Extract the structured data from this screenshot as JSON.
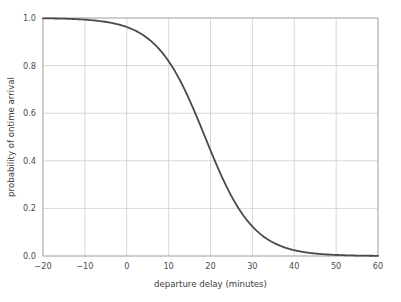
{
  "chart_data": {
    "type": "line",
    "title": "",
    "xlabel": "departure delay (minutes)",
    "ylabel": "probability of ontime arrival",
    "xlim": [
      -20,
      60
    ],
    "ylim": [
      0.0,
      1.0
    ],
    "grid": true,
    "legend": null,
    "xticks": [
      -20,
      -10,
      0,
      10,
      20,
      30,
      40,
      50,
      60
    ],
    "xticklabels": [
      "−20",
      "−10",
      "0",
      "10",
      "20",
      "30",
      "40",
      "50",
      "60"
    ],
    "yticks": [
      0.0,
      0.2,
      0.4,
      0.6,
      0.8,
      1.0
    ],
    "yticklabels": [
      "0.0",
      "0.2",
      "0.4",
      "0.6",
      "0.8",
      "1.0"
    ],
    "line_color": "#4a4a4a",
    "line_width": 1.8,
    "series": [
      {
        "name": "probability of ontime arrival",
        "x": [
          -20,
          -18,
          -16,
          -14,
          -12,
          -10,
          -8,
          -6,
          -4,
          -2,
          0,
          2,
          4,
          6,
          8,
          10,
          12,
          14,
          16,
          18,
          20,
          22,
          24,
          26,
          28,
          30,
          32,
          34,
          36,
          38,
          40,
          42,
          44,
          46,
          48,
          50,
          52,
          54,
          56,
          58,
          60
        ],
        "y": [
          0.9997,
          0.9995,
          0.9992,
          0.9988,
          0.9982,
          0.9973,
          0.9959,
          0.9938,
          0.9906,
          0.9858,
          0.9784,
          0.9672,
          0.9503,
          0.9252,
          0.8889,
          0.8386,
          0.7725,
          0.6914,
          0.6003,
          0.5066,
          0.417,
          0.336,
          0.2657,
          0.2067,
          0.1586,
          0.1201,
          0.09,
          0.0668,
          0.0493,
          0.0361,
          0.0263,
          0.0191,
          0.0139,
          0.01,
          0.0072,
          0.0052,
          0.0038,
          0.0027,
          0.002,
          0.0014,
          0.001
        ]
      }
    ],
    "curve_model": {
      "form": "logistic",
      "midpoint_x": 18.7,
      "steepness_k": 0.173,
      "description": "probability decreases sigmoidally from ~1.0 at -20 minutes to ~0.0 at 60 minutes"
    }
  },
  "axes": {
    "x_axis_title": "departure delay (minutes)",
    "y_axis_title": "probability of ontime arrival"
  },
  "colors": {
    "background": "#ffffff",
    "grid": "#d4d4d4",
    "spine": "#b0b0b0",
    "line": "#4a4a4a",
    "text": "#4d4d4d"
  }
}
